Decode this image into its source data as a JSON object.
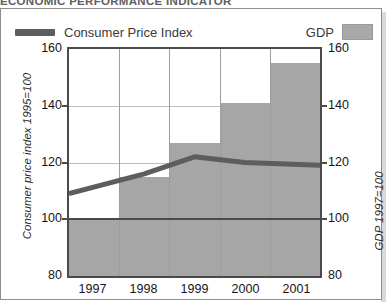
{
  "figure": {
    "title": "ECONOMIC PERFORMANCE INDICATOR"
  },
  "legend": {
    "cpi_label": "Consumer Price Index",
    "gdp_label": "GDP",
    "cpi_color": "#5d5d5d",
    "gdp_color": "#a6a6a6"
  },
  "axes": {
    "ylabel_left": "Consumer price index 1995=100",
    "ylabel_right": "GDP 1997=100",
    "yticks": [
      "160",
      "140",
      "120",
      "100",
      "80"
    ],
    "xticks": [
      "1997",
      "1998",
      "1999",
      "2000",
      "2001"
    ]
  },
  "chart_data": {
    "type": "bar",
    "title": "ECONOMIC PERFORMANCE INDICATOR",
    "categories": [
      "1997",
      "1998",
      "1999",
      "2000",
      "2001"
    ],
    "series": [
      {
        "name": "GDP",
        "type": "bar",
        "axis": "right",
        "values": [
          100,
          115,
          127,
          141,
          155
        ],
        "color": "#a6a6a6"
      },
      {
        "name": "Consumer Price Index",
        "type": "line",
        "axis": "left",
        "values": [
          109,
          116,
          122,
          120,
          119
        ],
        "color": "#5d5d5d"
      }
    ],
    "xlabel": "",
    "ylabel": "Consumer price index 1995=100",
    "ylabel_right": "GDP 1997=100",
    "ylim": [
      80,
      160
    ],
    "ylim_right": [
      80,
      160
    ],
    "ytick_values": [
      80,
      100,
      120,
      140,
      160
    ],
    "grid": true,
    "legend_position": "top"
  }
}
